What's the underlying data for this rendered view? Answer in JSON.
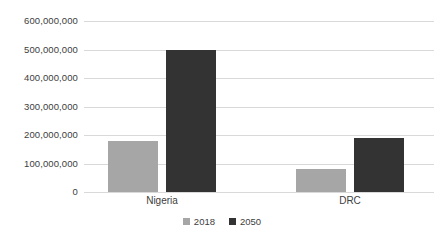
{
  "chart_data": {
    "type": "bar",
    "title": "",
    "subtitle": "",
    "xlabel": "",
    "ylabel": "",
    "categories": [
      "Nigeria",
      "DRC"
    ],
    "series": [
      {
        "name": "2018",
        "color": "#a6a6a6",
        "values": [
          180000000,
          82000000
        ]
      },
      {
        "name": "2050",
        "color": "#333333",
        "values": [
          500000000,
          190000000
        ]
      }
    ],
    "ylim": [
      0,
      600000000
    ],
    "ytick_values": [
      0,
      100000000,
      200000000,
      300000000,
      400000000,
      500000000,
      600000000
    ],
    "ytick_labels": [
      "0",
      "100,000,000",
      "200,000,000",
      "300,000,000",
      "400,000,000",
      "500,000,000",
      "600,000,000"
    ],
    "grid": true,
    "grid_axis": "y",
    "legend": [
      "2018",
      "2050"
    ],
    "legend_position": "bottom",
    "background_color": "#ffffff",
    "gridline_color": "#d9d9d9",
    "text_color": "#404040"
  }
}
